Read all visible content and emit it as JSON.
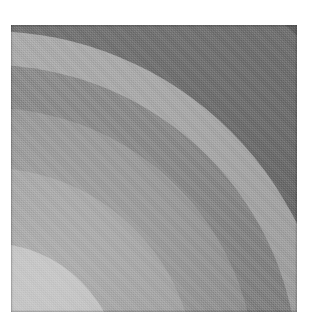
{
  "figure": {
    "medium": "halftone print scan",
    "background_color": "#ffffff",
    "plate": {
      "x": 11,
      "y": 25,
      "width": 286,
      "height": 287,
      "border_color": "#6f6f6f"
    }
  },
  "chart_data": {
    "type": "heatmap",
    "title": "",
    "subtitle": "",
    "xlabel": "",
    "ylabel": "",
    "grid": false,
    "legend_position": "none",
    "center": {
      "x_frac": -0.08,
      "y_frac": 1.22
    },
    "bands": [
      {
        "index": 0,
        "label": "band-1-lightest",
        "radius_frac": 0.46,
        "gray": "#c8c8c8",
        "gray_value": 200
      },
      {
        "index": 1,
        "label": "band-2-light",
        "radius_frac": 0.72,
        "gray": "#a9a9a9",
        "gray_value": 169
      },
      {
        "index": 2,
        "label": "band-3-mid",
        "radius_frac": 0.93,
        "gray": "#9b9b9b",
        "gray_value": 155
      },
      {
        "index": 3,
        "label": "band-4-mid-dark",
        "radius_frac": 1.08,
        "gray": "#8a8a8a",
        "gray_value": 138
      },
      {
        "index": 4,
        "label": "band-5-light-sliver",
        "radius_frac": 1.2,
        "gray": "#ababab",
        "gray_value": 171
      },
      {
        "index": 5,
        "label": "band-6-dark",
        "radius_frac": 1.34,
        "gray": "#6e6e6e",
        "gray_value": 110
      },
      {
        "index": 6,
        "label": "band-7-darkest",
        "radius_frac": 1.6,
        "gray": "#5e5e5e",
        "gray_value": 94
      }
    ],
    "axis_ranges": {
      "x": [
        0,
        1
      ],
      "y": [
        0,
        1
      ]
    },
    "tick_labels": {
      "x": [],
      "y": []
    },
    "annotations": []
  }
}
